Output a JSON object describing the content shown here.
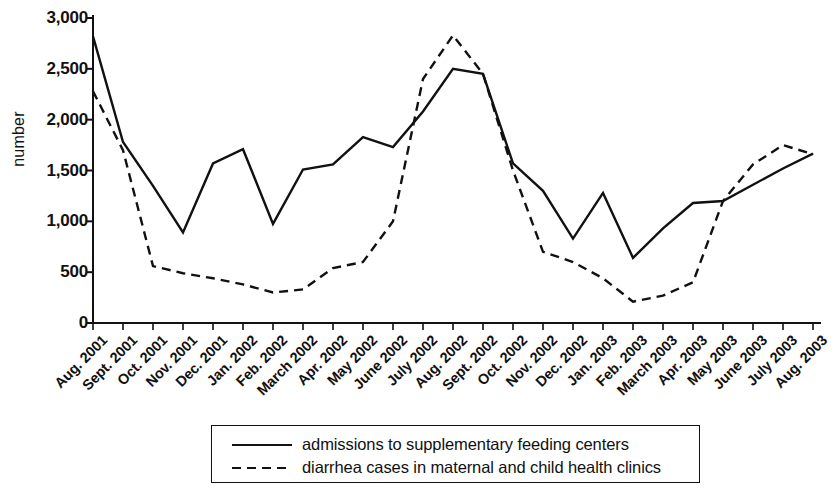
{
  "chart_data": {
    "type": "line",
    "title": "",
    "xlabel": "",
    "ylabel": "number",
    "ylim": [
      0,
      3000
    ],
    "ytick_labels": [
      "0",
      "500",
      "1,000",
      "1,500",
      "2,000",
      "2,500",
      "3,000"
    ],
    "ytick_values": [
      0,
      500,
      1000,
      1500,
      2000,
      2500,
      3000
    ],
    "grid": false,
    "legend_position": "bottom",
    "categories": [
      "Aug. 2001",
      "Sept. 2001",
      "Oct. 2001",
      "Nov. 2001",
      "Dec. 2001",
      "Jan. 2002",
      "Feb. 2002",
      "March 2002",
      "Apr. 2002",
      "May 2002",
      "June 2002",
      "July 2002",
      "Aug. 2002",
      "Sept. 2002",
      "Oct. 2002",
      "Nov. 2002",
      "Dec. 2002",
      "Jan. 2003",
      "Feb. 2003",
      "March 2003",
      "Apr. 2003",
      "May 2003",
      "June 2003",
      "July 2003",
      "Aug. 2003"
    ],
    "series": [
      {
        "name": "admissions to supplementary feeding centers",
        "style": "solid",
        "color": "#111111",
        "values": [
          2820,
          1780,
          1350,
          890,
          1570,
          1710,
          975,
          1510,
          1560,
          1830,
          1730,
          2080,
          2500,
          2450,
          1570,
          1300,
          830,
          1280,
          640,
          930,
          1180,
          1200,
          1360,
          1520,
          1665
        ]
      },
      {
        "name": "diarrhea cases in maternal and child health clinics",
        "style": "dashed",
        "color": "#111111",
        "values": [
          2280,
          1700,
          560,
          490,
          440,
          380,
          300,
          330,
          540,
          600,
          1000,
          2400,
          2830,
          2450,
          1500,
          700,
          600,
          440,
          210,
          270,
          400,
          1200,
          1560,
          1750,
          1660
        ]
      }
    ]
  },
  "legend": {
    "items": [
      {
        "label": "admissions to supplementary feeding centers",
        "style": "solid"
      },
      {
        "label": "diarrhea cases in maternal and child health clinics",
        "style": "dashed"
      }
    ]
  }
}
